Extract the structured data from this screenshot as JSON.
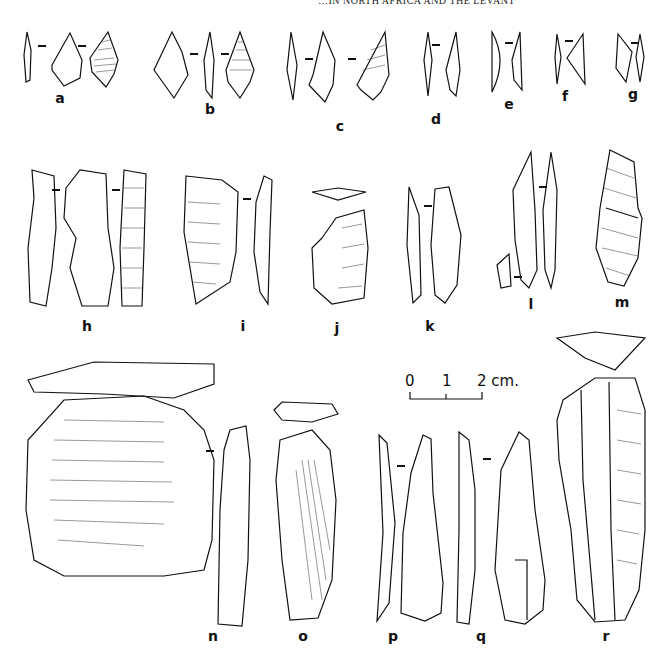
{
  "running_head": "…IN NORTH AFRICA AND THE LEVANT",
  "scale_bar": {
    "ticks": [
      "0",
      "1",
      "2 cm."
    ],
    "unit": "cm"
  },
  "labels": {
    "a": "a",
    "b": "b",
    "c": "c",
    "d": "d",
    "e": "e",
    "f": "f",
    "g": "g",
    "h": "h",
    "i": "i",
    "j": "j",
    "k": "k",
    "l": "l",
    "m": "m",
    "n": "n",
    "o": "o",
    "p": "p",
    "q": "q",
    "r": "r"
  },
  "artifacts": [
    {
      "id": "a",
      "type": "point",
      "views": 3
    },
    {
      "id": "b",
      "type": "point",
      "views": 3
    },
    {
      "id": "c",
      "type": "point",
      "views": 2
    },
    {
      "id": "d",
      "type": "bladelet",
      "views": 2
    },
    {
      "id": "e",
      "type": "backed bladelet",
      "views": 2
    },
    {
      "id": "f",
      "type": "microlith",
      "views": 2
    },
    {
      "id": "g",
      "type": "microlith",
      "views": 2
    },
    {
      "id": "h",
      "type": "blade",
      "views": 3
    },
    {
      "id": "i",
      "type": "blade",
      "views": 2
    },
    {
      "id": "j",
      "type": "scraper",
      "views": 2
    },
    {
      "id": "k",
      "type": "blade",
      "views": 2
    },
    {
      "id": "l",
      "type": "blade",
      "views": 3
    },
    {
      "id": "m",
      "type": "burin",
      "views": 1
    },
    {
      "id": "n",
      "type": "scraper",
      "views": 3
    },
    {
      "id": "o",
      "type": "end scraper",
      "views": 2
    },
    {
      "id": "p",
      "type": "blade",
      "views": 2
    },
    {
      "id": "q",
      "type": "blade",
      "views": 2
    },
    {
      "id": "r",
      "type": "blade core / end scraper",
      "views": 2
    }
  ]
}
